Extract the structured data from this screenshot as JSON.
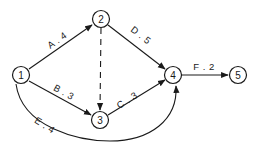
{
  "diagram": {
    "type": "activity-network",
    "nodes": [
      {
        "id": "1",
        "label": "1",
        "x": 21,
        "y": 75
      },
      {
        "id": "2",
        "label": "2",
        "x": 101,
        "y": 19
      },
      {
        "id": "3",
        "label": "3",
        "x": 100,
        "y": 120
      },
      {
        "id": "4",
        "label": "4",
        "x": 173,
        "y": 75
      },
      {
        "id": "5",
        "label": "5",
        "x": 238,
        "y": 75
      }
    ],
    "edges": [
      {
        "id": "A",
        "from": "1",
        "to": "2",
        "label": "A . 4",
        "activity": "A",
        "duration": 4,
        "style": "solid"
      },
      {
        "id": "B",
        "from": "1",
        "to": "3",
        "label": "B . 3",
        "activity": "B",
        "duration": 3,
        "style": "solid"
      },
      {
        "id": "C",
        "from": "3",
        "to": "4",
        "label": "C . 3",
        "activity": "C",
        "duration": 3,
        "style": "solid"
      },
      {
        "id": "D",
        "from": "2",
        "to": "4",
        "label": "D . 5",
        "activity": "D",
        "duration": 5,
        "style": "solid"
      },
      {
        "id": "E",
        "from": "1",
        "to": "4",
        "label": "E . 4",
        "activity": "E",
        "duration": 4,
        "style": "solid-curved"
      },
      {
        "id": "F",
        "from": "4",
        "to": "5",
        "label": "F . 2",
        "activity": "F",
        "duration": 2,
        "style": "solid"
      },
      {
        "id": "dummy",
        "from": "2",
        "to": "3",
        "label": "",
        "activity": "dummy",
        "duration": 0,
        "style": "dashed"
      }
    ],
    "colors": {
      "stroke": "#1a1a1a",
      "background": "#ffffff"
    }
  }
}
